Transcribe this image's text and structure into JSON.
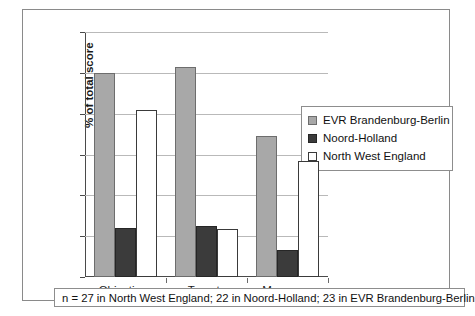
{
  "chart_data": {
    "type": "bar",
    "title": "",
    "xlabel": "",
    "ylabel": "% of total score",
    "ylim": [
      0,
      60
    ],
    "ytick_step": 10,
    "yticks": [
      0,
      10,
      20,
      30,
      40,
      50,
      60
    ],
    "grid": true,
    "legend_position": "right",
    "categories": [
      "Objectives",
      "Targets",
      "Measures"
    ],
    "series": [
      {
        "name": "EVR Brandenburg-Berlin",
        "color": "#a8a8a8",
        "values": [
          50.0,
          51.5,
          34.5
        ]
      },
      {
        "name": "Noord-Holland",
        "color": "#3b3b3b",
        "values": [
          12.0,
          12.5,
          6.7
        ]
      },
      {
        "name": "North West England",
        "color": "#ffffff",
        "values": [
          40.8,
          11.8,
          28.5
        ]
      }
    ],
    "caption": "n = 27 in North West England; 22 in Noord-Holland; 23 in EVR Brandenburg-Berlin"
  }
}
